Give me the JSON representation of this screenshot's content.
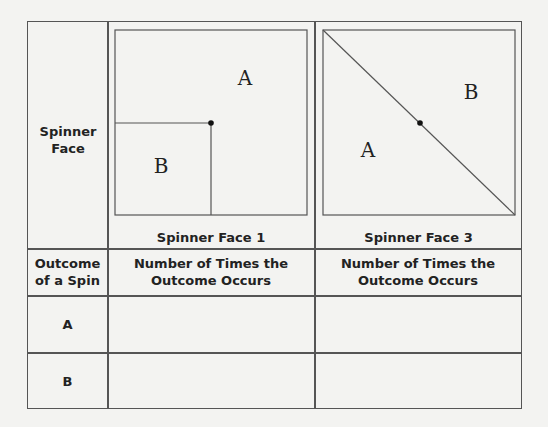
{
  "header": {
    "row_label": "Spinner Face",
    "face1_label": "Spinner Face 1",
    "face3_label": "Spinner Face 3"
  },
  "spinner_face_1": {
    "region_large": "A",
    "region_small": "B"
  },
  "spinner_face_3": {
    "region_lower_left": "A",
    "region_upper_right": "B"
  },
  "table": {
    "col_headers": [
      "Outcome of a Spin",
      "Number of Times the Outcome Occurs",
      "Number of Times the Outcome Occurs"
    ],
    "rows": [
      {
        "outcome": "A",
        "face1": "",
        "face3": ""
      },
      {
        "outcome": "B",
        "face1": "",
        "face3": ""
      }
    ]
  }
}
